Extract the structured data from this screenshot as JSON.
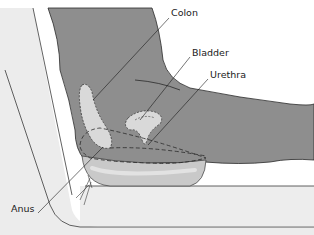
{
  "diagram": {
    "type": "anatomical-illustration",
    "labels": [
      {
        "id": "colon",
        "text": "Colon",
        "x": 171,
        "y": 13
      },
      {
        "id": "bladder",
        "text": "Bladder",
        "x": 192,
        "y": 52
      },
      {
        "id": "urethra",
        "text": "Urethra",
        "x": 210,
        "y": 74
      },
      {
        "id": "anus",
        "text": "Anus",
        "x": 11,
        "y": 208
      }
    ],
    "colors": {
      "body": "#8e8e8e",
      "body_outline": "#2a2a2a",
      "organ_fill": "#d9d9d9",
      "chair": "#ececec",
      "chair_outline": "#3a3a3a",
      "cushion": "#c9c9c9",
      "background": "#ffffff"
    }
  }
}
